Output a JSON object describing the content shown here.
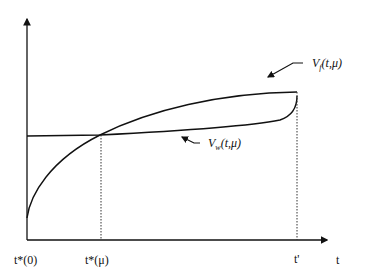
{
  "diagram": {
    "x_axis_label": "t",
    "x_ticks": [
      {
        "id": "t0",
        "label": "t*(0)"
      },
      {
        "id": "tmu",
        "label": "t*(μ)"
      },
      {
        "id": "tprime",
        "label": "t'"
      }
    ],
    "curves": [
      {
        "id": "vf",
        "label_main": "V",
        "label_sub": "f",
        "label_args": "(t,μ)"
      },
      {
        "id": "vw",
        "label_main": "V",
        "label_sub": "w",
        "label_args": "(t,μ)"
      }
    ],
    "colors": {
      "line": "#111111",
      "background": "#ffffff"
    }
  }
}
